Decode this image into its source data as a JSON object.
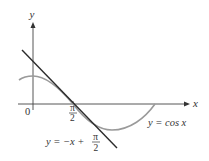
{
  "diagram": {
    "type": "function-graph",
    "axes": {
      "x_label": "x",
      "y_label": "y",
      "origin_label": "0"
    },
    "tick_labels": {
      "pi_half_numerator": "π",
      "pi_half_denominator": "2"
    },
    "curves": [
      {
        "name": "cosine",
        "label": "y = cos x",
        "color": "#9a9a9a"
      },
      {
        "name": "tangent-line",
        "label_prefix": "y = −x + ",
        "label_frac_num": "π",
        "label_frac_den": "2",
        "color": "#2b2b2b"
      }
    ]
  }
}
